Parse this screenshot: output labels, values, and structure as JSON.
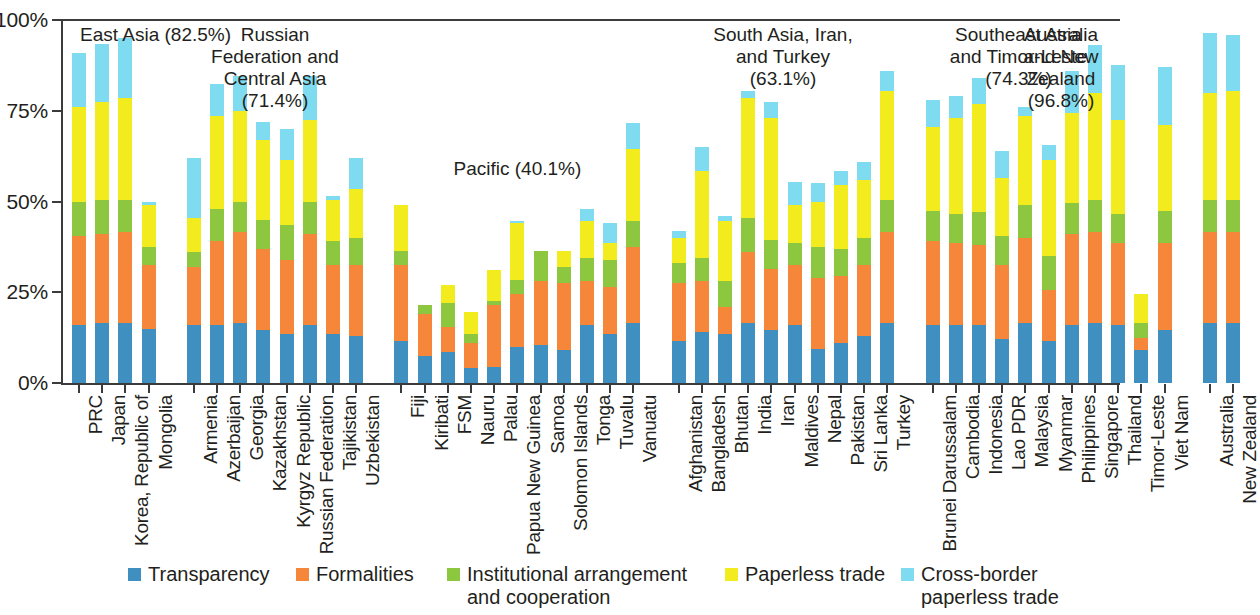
{
  "chart_data": {
    "type": "bar",
    "subtype": "stacked-bar-percent",
    "title": "",
    "xlabel": "",
    "ylabel": "",
    "ylim": [
      0,
      100
    ],
    "ytick_labels": [
      "0%",
      "25%",
      "50%",
      "75%",
      "100%"
    ],
    "ytick_values": [
      0,
      25,
      50,
      75,
      100
    ],
    "grid": false,
    "legend_position": "bottom",
    "series": [
      {
        "name": "Transparency",
        "key": "transparency",
        "color": "#3f8fc0"
      },
      {
        "name": "Formalities",
        "key": "formalities",
        "color": "#f6873a"
      },
      {
        "name": "Institutional arrangement\nand cooperation",
        "key": "institutional",
        "color": "#8dc63f"
      },
      {
        "name": "Paperless trade",
        "key": "paperless",
        "color": "#f2eb1d"
      },
      {
        "name": "Cross-border paperless trade",
        "key": "crossborder",
        "color": "#7fdbf0"
      }
    ],
    "groups": [
      {
        "label": "East Asia (82.5%)",
        "average": 82.5,
        "categories": [
          "PRC",
          "Japan",
          "Korea, Republic of",
          "Mongolia"
        ],
        "values": {
          "transparency": [
            16.0,
            16.5,
            16.5,
            15.0
          ],
          "formalities": [
            24.5,
            24.5,
            25.0,
            17.5
          ],
          "institutional": [
            9.5,
            9.5,
            9.0,
            5.0
          ],
          "paperless": [
            26.0,
            27.0,
            28.0,
            11.5
          ],
          "crossborder": [
            15.0,
            16.0,
            16.5,
            1.0
          ]
        }
      },
      {
        "label": "Russian\nFederation and\nCentral Asia\n(71.4%)",
        "average": 71.4,
        "categories": [
          "Armenia",
          "Azerbaijan",
          "Georgia",
          "Kazakhstan",
          "Kyrgyz Republic",
          "Russian Federation",
          "Tajikistan",
          "Uzbekistan"
        ],
        "values": {
          "transparency": [
            16.0,
            16.0,
            16.5,
            14.5,
            13.5,
            16.0,
            13.5,
            13.0
          ],
          "formalities": [
            16.0,
            23.0,
            25.0,
            22.5,
            20.5,
            25.0,
            19.0,
            19.5
          ],
          "institutional": [
            4.0,
            9.0,
            8.5,
            8.0,
            9.5,
            9.0,
            6.5,
            7.5
          ],
          "paperless": [
            9.5,
            25.5,
            25.0,
            22.0,
            18.0,
            22.5,
            11.5,
            13.5
          ],
          "crossborder": [
            16.5,
            9.0,
            9.5,
            5.0,
            8.5,
            12.0,
            1.0,
            8.5
          ]
        }
      },
      {
        "label": "Pacific (40.1%)",
        "average": 40.1,
        "categories": [
          "Fiji",
          "Kiribati",
          "FSM",
          "Nauru",
          "Palau",
          "Papua New Guinea",
          "Samoa",
          "Solomon Islands",
          "Tonga",
          "Tuvalu",
          "Vanuatu"
        ],
        "values": {
          "transparency": [
            11.5,
            7.5,
            8.5,
            4.0,
            4.5,
            10.0,
            10.5,
            9.0,
            16.0,
            13.5,
            16.5
          ],
          "formalities": [
            21.0,
            11.5,
            7.0,
            7.0,
            17.0,
            14.5,
            17.5,
            18.5,
            12.0,
            13.0,
            21.0
          ],
          "institutional": [
            4.0,
            2.5,
            6.5,
            2.5,
            1.0,
            4.0,
            8.5,
            4.5,
            6.5,
            7.5,
            7.0
          ],
          "paperless": [
            12.5,
            0.0,
            5.0,
            6.0,
            8.5,
            15.5,
            0.0,
            4.5,
            10.0,
            4.5,
            20.0
          ],
          "crossborder": [
            0.0,
            0.0,
            0.0,
            0.0,
            0.0,
            0.5,
            0.0,
            0.0,
            3.5,
            5.5,
            7.0
          ]
        }
      },
      {
        "label": "South Asia, Iran,\nand Turkey\n(63.1%)",
        "average": 63.1,
        "categories": [
          "Afghanistan",
          "Bangladesh",
          "Bhutan",
          "India",
          "Iran",
          "Maldives",
          "Nepal",
          "Pakistan",
          "Sri Lanka",
          "Turkey"
        ],
        "values": {
          "transparency": [
            11.5,
            14.0,
            13.5,
            16.5,
            14.5,
            16.0,
            9.5,
            11.0,
            13.0,
            16.5
          ],
          "formalities": [
            16.0,
            14.0,
            7.5,
            19.5,
            17.0,
            16.5,
            19.5,
            18.5,
            19.5,
            25.0
          ],
          "institutional": [
            5.5,
            6.5,
            7.0,
            9.5,
            8.0,
            6.0,
            8.5,
            7.5,
            7.5,
            9.0
          ],
          "paperless": [
            7.0,
            24.0,
            16.5,
            33.0,
            33.5,
            10.5,
            12.5,
            17.5,
            16.0,
            30.0
          ],
          "crossborder": [
            2.0,
            6.5,
            1.5,
            2.0,
            4.5,
            6.5,
            5.0,
            4.0,
            5.0,
            5.5
          ]
        }
      },
      {
        "label": "Southeast Asia\nand Timor-Leste\n(74.3%)",
        "average": 74.3,
        "categories": [
          "Brunei Darussalam",
          "Cambodia",
          "Indonesia",
          "Lao PDR",
          "Malaysia",
          "Myanmar",
          "Philippines",
          "Singapore",
          "Thailand",
          "Timor-Leste",
          "Viet Nam"
        ],
        "values": {
          "transparency": [
            16.0,
            16.0,
            16.0,
            12.0,
            16.5,
            11.5,
            16.0,
            16.5,
            16.0,
            9.0,
            14.5
          ],
          "formalities": [
            23.0,
            22.5,
            22.0,
            20.5,
            23.5,
            14.0,
            25.0,
            25.0,
            22.5,
            3.5,
            24.0
          ],
          "institutional": [
            8.5,
            8.0,
            9.0,
            8.0,
            9.0,
            9.5,
            8.5,
            9.0,
            8.0,
            4.0,
            9.0
          ],
          "paperless": [
            23.0,
            26.5,
            30.0,
            16.0,
            24.5,
            26.5,
            25.0,
            29.5,
            26.0,
            8.0,
            23.5
          ],
          "crossborder": [
            7.5,
            6.0,
            7.0,
            7.5,
            2.5,
            4.0,
            11.5,
            13.0,
            15.0,
            0.0,
            16.0
          ]
        }
      },
      {
        "label": "Australia\nand New\nZealand\n(96.8%)",
        "average": 96.8,
        "categories": [
          "Australia",
          "New Zealand"
        ],
        "values": {
          "transparency": [
            16.5,
            16.5
          ],
          "formalities": [
            25.0,
            25.0
          ],
          "institutional": [
            9.0,
            9.0
          ],
          "paperless": [
            29.5,
            30.0
          ],
          "crossborder": [
            16.5,
            15.5
          ]
        }
      }
    ]
  }
}
